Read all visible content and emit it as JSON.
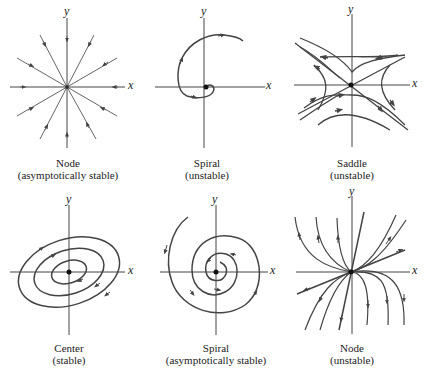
{
  "panels": [
    {
      "id": "node-stable",
      "title": "Node",
      "subtitle": "(asymptotically stable)",
      "x_label": "x",
      "y_label": "y"
    },
    {
      "id": "spiral-unstable",
      "title": "Spiral",
      "subtitle": "(unstable)",
      "x_label": "x",
      "y_label": "y"
    },
    {
      "id": "saddle",
      "title": "Saddle",
      "subtitle": "(unstable)",
      "x_label": "x",
      "y_label": "y"
    },
    {
      "id": "center",
      "title": "Center",
      "subtitle": "(stable)",
      "x_label": "x",
      "y_label": "y"
    },
    {
      "id": "spiral-stable",
      "title": "Spiral",
      "subtitle": "(asymptotically stable)",
      "x_label": "x",
      "y_label": "y"
    },
    {
      "id": "node-unstable",
      "title": "Node",
      "subtitle": "(unstable)",
      "x_label": "x",
      "y_label": "y"
    }
  ],
  "colors": {
    "trajectory": "#555555",
    "axis": "#444444",
    "point": "#111111"
  }
}
